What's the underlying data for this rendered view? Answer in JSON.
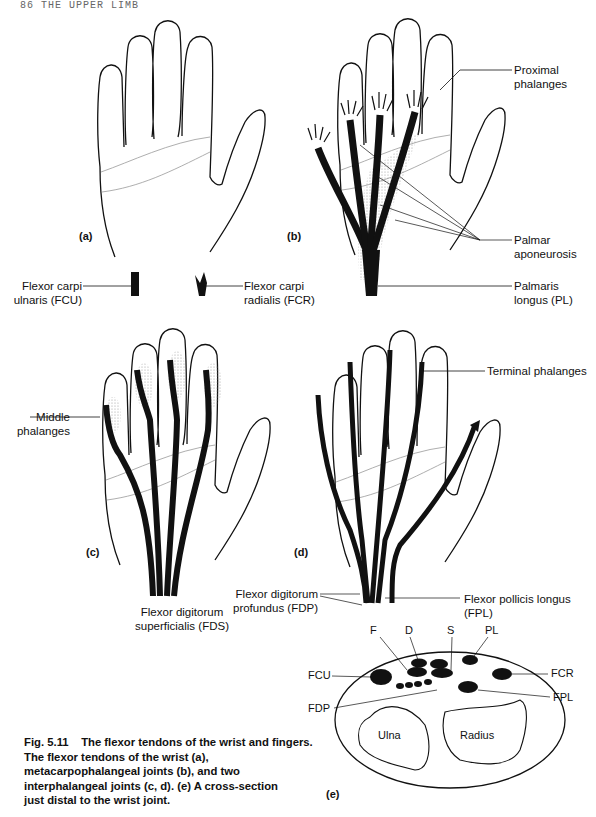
{
  "header": {
    "running_head": "86  THE UPPER LIMB"
  },
  "panels": {
    "a": {
      "label": "(a)",
      "callouts": {
        "fcu_line1": "Flexor carpi",
        "fcu_line2": "ulnaris (FCU)",
        "fcr_line1": "Flexor carpi",
        "fcr_line2": "radialis (FCR)"
      }
    },
    "b": {
      "label": "(b)",
      "callouts": {
        "proximal_line1": "Proximal",
        "proximal_line2": "phalanges",
        "palmar_line1": "Palmar",
        "palmar_line2": "aponeurosis",
        "pl_line1": "Palmaris",
        "pl_line2": "longus (PL)"
      }
    },
    "c": {
      "label": "(c)",
      "callouts": {
        "middle_line1": "Middle",
        "middle_line2": "phalanges",
        "fds_line1": "Flexor digitorum",
        "fds_line2": "superficialis (FDS)"
      }
    },
    "d": {
      "label": "(d)",
      "callouts": {
        "terminal": "Terminal phalanges",
        "fdp_line1": "Flexor digitorum",
        "fdp_line2": "profundus (FDP)",
        "fpl_line1": "Flexor pollicis longus",
        "fpl_line2": "(FPL)"
      }
    },
    "e": {
      "label": "(e)",
      "labels": {
        "F": "F",
        "D": "D",
        "S": "S",
        "PL": "PL",
        "FCU": "FCU",
        "FCR": "FCR",
        "FPL": "FPL",
        "FDP": "FDP",
        "ulna": "Ulna",
        "radius": "Radius"
      }
    }
  },
  "caption": {
    "title": "Fig. 5.11    The flexor tendons of the wrist and fingers.",
    "body": "The flexor tendons of the wrist (a), metacarpophalangeal joints (b), and two interphalangeal joints (c, d). (e) A cross-section just distal to the wrist joint."
  }
}
